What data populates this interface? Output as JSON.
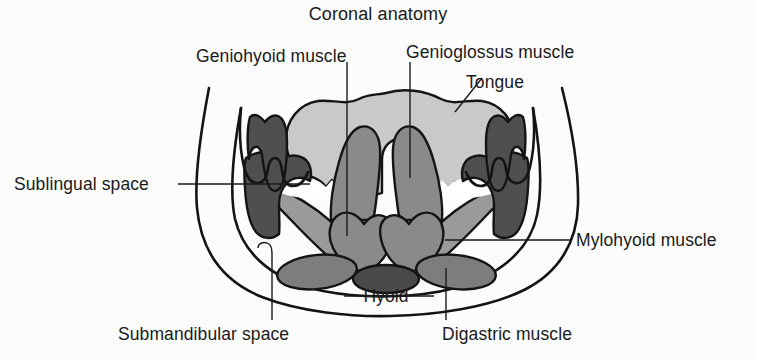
{
  "figure": {
    "title": "Coronal anatomy",
    "kind": "anatomical-illustration",
    "region": "floor of mouth / suprahyoid neck",
    "view": "coronal cross-section"
  },
  "labels": {
    "title": "Coronal anatomy",
    "geniohyoid": "Geniohyoid muscle",
    "genioglossus": "Genioglossus muscle",
    "tongue": "Tongue",
    "sublingual_space": "Sublingual space",
    "mylohyoid": "Mylohyoid muscle",
    "hyoid": "Hyoid",
    "submandibular_space": "Submandibular space",
    "digastric": "Digastric muscle"
  },
  "colors": {
    "background": "#fcfcfc",
    "ink": "#1a1a1a",
    "outline": "#141414",
    "tongue_fill": "#c9c9c9",
    "sublingual_fill": "#f4f4f4",
    "genioglossus_fill": "#8a8a8a",
    "geniohyoid_fill": "#8a8a8a",
    "mandible_fill": "#4f4f4f",
    "tooth_fill": "#4f4f4f",
    "mylohyoid_fill": "#9a9a9a",
    "digastric_fill": "#7d7d7d",
    "hyoid_fill": "#4a4a4a",
    "skin_fill": "#ffffff"
  },
  "structures": [
    {
      "name": "tongue",
      "label": "Tongue",
      "shade": "light-gray",
      "count": 1
    },
    {
      "name": "genioglossus-muscle",
      "label": "Genioglossus muscle",
      "shade": "mid-gray",
      "count": 2
    },
    {
      "name": "geniohyoid-muscle",
      "label": "Geniohyoid muscle",
      "shade": "mid-gray",
      "count": 2
    },
    {
      "name": "mylohyoid-muscle",
      "label": "Mylohyoid muscle",
      "shade": "mid-gray",
      "count": 2
    },
    {
      "name": "digastric-muscle",
      "label": "Digastric muscle",
      "shade": "mid-dark-gray",
      "count": 2
    },
    {
      "name": "hyoid-bone",
      "label": "Hyoid",
      "shade": "dark-gray",
      "count": 1
    },
    {
      "name": "mandible",
      "label": "Mandible",
      "shade": "dark-gray",
      "count": 2
    },
    {
      "name": "molar-tooth",
      "label": "Tooth",
      "shade": "dark-gray",
      "count": 2
    },
    {
      "name": "sublingual-space",
      "label": "Sublingual space",
      "shade": "white",
      "count": 2
    },
    {
      "name": "submandibular-space",
      "label": "Submandibular space",
      "shade": "white",
      "count": 2
    }
  ]
}
